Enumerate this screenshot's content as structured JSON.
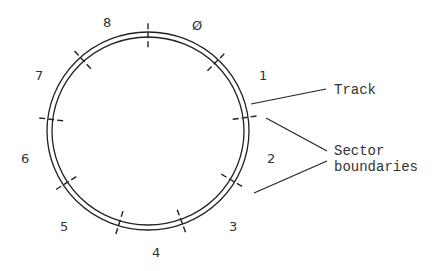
{
  "diagram": {
    "colors": {
      "line": "#222222",
      "text": "#333333",
      "background": "#ffffff"
    },
    "track": {
      "center": [
        148,
        131
      ],
      "outer_radius": [
        101,
        99
      ],
      "inner_radius": [
        96,
        94
      ]
    },
    "sector_boundary_angles_deg": [
      0,
      44,
      82,
      121,
      160,
      197,
      237,
      277,
      318
    ],
    "sectors": [
      {
        "label": "Ø",
        "x": 192,
        "y": 30
      },
      {
        "label": "1",
        "x": 259,
        "y": 80
      },
      {
        "label": "2",
        "x": 267,
        "y": 163
      },
      {
        "label": "3",
        "x": 229,
        "y": 231
      },
      {
        "label": "4",
        "x": 152,
        "y": 257
      },
      {
        "label": "5",
        "x": 60,
        "y": 231
      },
      {
        "label": "6",
        "x": 21,
        "y": 163
      },
      {
        "label": "7",
        "x": 35,
        "y": 80
      },
      {
        "label": "8",
        "x": 103,
        "y": 27
      }
    ],
    "callouts": {
      "track": {
        "label": "Track"
      },
      "sector_boundaries": {
        "line1": "Sector",
        "line2": "boundaries"
      }
    }
  }
}
